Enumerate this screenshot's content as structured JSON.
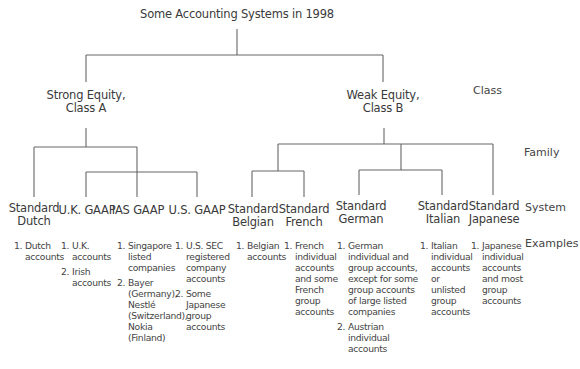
{
  "title": "Some Accounting Systems in 1998",
  "levels": {
    "class": "Class",
    "family": "Family",
    "system": "System",
    "examples": "Examples"
  },
  "classes": [
    {
      "label": "Strong Equity,\nClass A",
      "line1": "Strong Equity,",
      "line2": "Class A"
    },
    {
      "label": "Weak Equity,\nClass B",
      "line1": "Weak Equity,",
      "line2": "Class B"
    }
  ],
  "systems": [
    {
      "line1": "Standard",
      "line2": "Dutch",
      "examples": [
        {
          "num": "1.",
          "text": "Dutch\naccounts"
        }
      ]
    },
    {
      "line1": "U.K. GAAP",
      "line2": "",
      "examples": [
        {
          "num": "1.",
          "text": "U.K.\naccounts"
        },
        {
          "num": "2.",
          "text": "Irish\naccounts"
        }
      ]
    },
    {
      "line1": "IAS GAAP",
      "line2": "",
      "examples": [
        {
          "num": "1.",
          "text": "Singapore\nlisted\ncompanies"
        },
        {
          "num": "2.",
          "text": "Bayer\n(Germany),\nNestlé\n(Switzerland),\nNokia\n(Finland)"
        }
      ]
    },
    {
      "line1": "U.S. GAAP",
      "line2": "",
      "examples": [
        {
          "num": "1.",
          "text": "U.S. SEC\nregistered\ncompany\naccounts"
        },
        {
          "num": "2.",
          "text": "Some\nJapanese\ngroup\naccounts"
        }
      ]
    },
    {
      "line1": "Standard",
      "line2": "Belgian",
      "examples": [
        {
          "num": "1.",
          "text": "Belgian\naccounts"
        }
      ]
    },
    {
      "line1": "Standard",
      "line2": "French",
      "examples": [
        {
          "num": "1.",
          "text": "French\nindividual\naccounts\nand some\nFrench\ngroup\naccounts"
        }
      ]
    },
    {
      "line1": "Standard",
      "line2": "German",
      "examples": [
        {
          "num": "1.",
          "text": "German\nindividual and\ngroup accounts,\nexcept for some\ngroup accounts\nof large listed\ncompanies"
        },
        {
          "num": "2.",
          "text": "Austrian\nindividual\naccounts"
        }
      ]
    },
    {
      "line1": "Standard",
      "line2": "Italian",
      "examples": [
        {
          "num": "1.",
          "text": "Italian\nindividual\naccounts\nor\nunlisted\ngroup\naccounts"
        }
      ]
    },
    {
      "line1": "Standard",
      "line2": "Japanese",
      "examples": [
        {
          "num": "1.",
          "text": "Japanese\nindividual\naccounts\nand most\ngroup\naccounts"
        }
      ]
    }
  ],
  "colors": {
    "line": "#666666",
    "text": "#3a3a3a",
    "background": "#ffffff"
  }
}
